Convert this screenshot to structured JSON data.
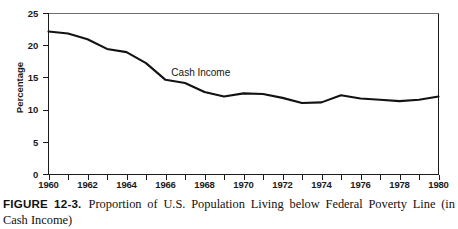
{
  "figure": {
    "number_label": "FIGURE 12-3.",
    "caption_text": "Proportion of U.S. Population Living below Federal Poverty Line (in Cash Income)"
  },
  "chart_data": {
    "type": "line",
    "title": "",
    "subtitle": "",
    "xlabel": "",
    "ylabel": "Percentage",
    "xlim": [
      1960,
      1980
    ],
    "ylim": [
      0,
      25
    ],
    "grid": false,
    "legend_position": "inline-annotation",
    "y_ticks": [
      0,
      5,
      10,
      15,
      20,
      25
    ],
    "y_tick_labels": [
      "0",
      "5",
      "10",
      "15",
      "20",
      "25"
    ],
    "x_ticks": [
      1960,
      1961,
      1962,
      1963,
      1964,
      1965,
      1966,
      1967,
      1968,
      1969,
      1970,
      1971,
      1972,
      1973,
      1974,
      1975,
      1976,
      1977,
      1978,
      1979,
      1980
    ],
    "x_tick_labels": [
      "1960",
      "1962",
      "1964",
      "1966",
      "1968",
      "1970",
      "1972",
      "1974",
      "1976",
      "1978",
      "1980"
    ],
    "x_labeled_ticks": [
      1960,
      1962,
      1964,
      1966,
      1968,
      1970,
      1972,
      1974,
      1976,
      1978,
      1980
    ],
    "annotations": [
      {
        "text": "Cash Income",
        "x": 1966.3,
        "y": 15.8
      }
    ],
    "series": [
      {
        "name": "Cash Income",
        "color": "#121212",
        "x": [
          1960,
          1961,
          1962,
          1963,
          1964,
          1965,
          1966,
          1967,
          1968,
          1969,
          1970,
          1971,
          1972,
          1973,
          1974,
          1975,
          1976,
          1977,
          1978,
          1979,
          1980
        ],
        "values": [
          22.2,
          21.9,
          21.0,
          19.5,
          19.0,
          17.3,
          14.7,
          14.2,
          12.8,
          12.1,
          12.6,
          12.5,
          11.9,
          11.1,
          11.2,
          12.3,
          11.8,
          11.6,
          11.4,
          11.6,
          12.1
        ]
      }
    ]
  },
  "axis_colors": {
    "axis": "#1b1b1b",
    "line": "#121212",
    "top_rule": "#6f6f6f"
  }
}
